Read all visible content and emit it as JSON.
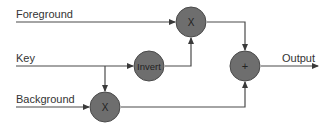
{
  "diagram": {
    "type": "signal-flow",
    "inputs": [
      {
        "id": "foreground",
        "label": "Foreground"
      },
      {
        "id": "key",
        "label": "Key"
      },
      {
        "id": "background",
        "label": "Background"
      }
    ],
    "nodes": [
      {
        "id": "multiply_fg",
        "symbol": "X"
      },
      {
        "id": "invert",
        "symbol": "Invert"
      },
      {
        "id": "multiply_bg",
        "symbol": "X"
      },
      {
        "id": "add",
        "symbol": "+"
      }
    ],
    "output": {
      "label": "Output"
    },
    "colors": {
      "node_fill": "#6e6e6e",
      "wire": "#4a4a4a",
      "text": "#333333"
    }
  }
}
